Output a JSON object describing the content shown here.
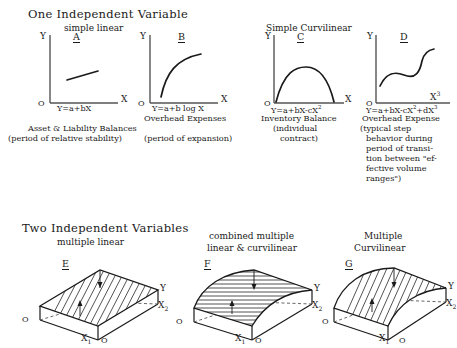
{
  "section_one": {
    "title": "One Independent Variable",
    "subtitle_left": "simple linear",
    "subtitle_right": "Simple Curvilinear",
    "panels": [
      {
        "key": "A",
        "label": "A",
        "y_axis": "Y",
        "x_axis": "X",
        "origin": "O",
        "equation_main": "Y=a+bX",
        "equation_sup": "",
        "equation_tail": "",
        "caption_lines": [
          "Asset & Liability Balances",
          "(period of relative stability)"
        ],
        "curve_type": "linear-segment"
      },
      {
        "key": "B",
        "label": "B",
        "y_axis": "Y",
        "x_axis": "X",
        "origin": "O",
        "equation_main": "Y=a+b log X",
        "equation_sup": "",
        "equation_tail": "",
        "caption_lines": [
          "Overhead Expenses",
          "(period of expansion)"
        ],
        "curve_type": "logarithmic"
      },
      {
        "key": "C",
        "label": "C",
        "y_axis": "Y",
        "x_axis": "X",
        "origin": "O",
        "equation_main": "Y=a+bX-cX",
        "equation_sup": "2",
        "equation_tail": "",
        "caption_lines": [
          "Inventory Balance",
          "(individual",
          "contract)"
        ],
        "curve_type": "quadratic-concave"
      },
      {
        "key": "D",
        "label": "D",
        "y_axis": "Y",
        "x_axis": "X",
        "x_axis_sup": "3",
        "origin": "O",
        "equation_main": "Y=a+bX-cX",
        "equation_sup": "2",
        "equation_tail": "+dX",
        "equation_tail_sup": "3",
        "caption_lines": [
          "Overhead Expense",
          "(typical step",
          "behavior during",
          "period of transi-",
          "tion between \"ef-",
          "fective volume",
          "ranges\")"
        ],
        "curve_type": "cubic-s"
      }
    ]
  },
  "section_two": {
    "title": "Two Independent Variables",
    "panels": [
      {
        "key": "E",
        "label": "E",
        "subtitle_lines": [
          "multiple linear"
        ],
        "y_axis": "Y",
        "x1_axis": "X",
        "x1_sub": "1",
        "x2_axis": "X",
        "x2_sub": "2",
        "origin_left": "O",
        "origin_front": "O",
        "surface": "planar-tilted",
        "hatch": "diagonal"
      },
      {
        "key": "F",
        "label": "F",
        "subtitle_lines": [
          "combined multiple",
          "linear & curvilinear"
        ],
        "y_axis": "Y",
        "x1_axis": "X",
        "x1_sub": "1",
        "x2_axis": "X",
        "x2_sub": "2",
        "origin_left": "O",
        "origin_front": "O",
        "surface": "curved-one-way",
        "hatch": "horizontal"
      },
      {
        "key": "G",
        "label": "G",
        "subtitle_lines": [
          "Multiple",
          "Curvilinear"
        ],
        "y_axis": "Y",
        "x1_axis": "X",
        "x1_sub": "1",
        "x2_axis": "X",
        "x2_sub": "2",
        "origin_left": "O",
        "origin_front": "O",
        "surface": "curved-dome",
        "hatch": "diagonal"
      }
    ]
  },
  "style": {
    "ink": "#1a1a1a",
    "axis": "#555555",
    "background": "#ffffff"
  }
}
